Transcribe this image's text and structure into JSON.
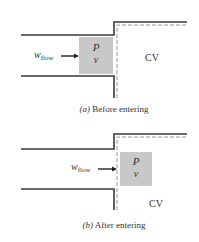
{
  "colors": {
    "wall": "#3a3a3a",
    "dash": "#9a9a9a",
    "fluid_element": "#c8c8c8",
    "text": "#333333",
    "arrow": "#222222"
  },
  "panel_a": {
    "label_w": "w",
    "label_w_sub": "flow",
    "element_p": "P",
    "element_v": "v",
    "cv_label": "CV",
    "caption_letter": "(a)",
    "caption_text": " Before entering"
  },
  "panel_b": {
    "label_w": "w",
    "label_w_sub": "flow",
    "element_p": "P",
    "element_v": "v",
    "cv_label": "CV",
    "caption_letter": "(b)",
    "caption_text": " After entering"
  }
}
